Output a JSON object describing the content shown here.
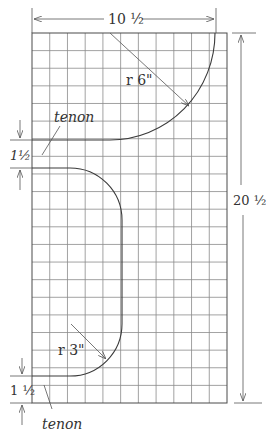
{
  "diagram": {
    "type": "grid-pattern-drawing",
    "grid": {
      "columns": 11,
      "rows": 21,
      "unit": "1 inch per square"
    },
    "dimensions": {
      "width_label": "10 ½",
      "height_label": "20 ½",
      "tenon_top_label": "1½",
      "tenon_bottom_label": "1 ½"
    },
    "radii": {
      "upper_label": "r  6\"",
      "lower_label": "r  3\""
    },
    "labels": {
      "tenon_top": "tenon",
      "tenon_bottom": "tenon"
    },
    "colors": {
      "line": "#3a3a3a",
      "grid": "#8a8a8a",
      "background": "#ffffff"
    }
  }
}
